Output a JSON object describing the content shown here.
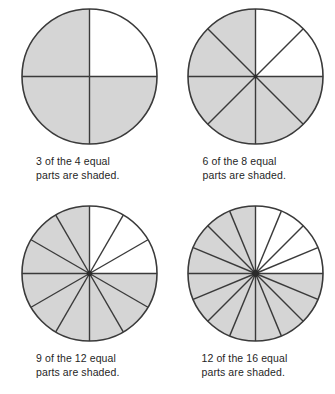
{
  "page": {
    "background_color": "#ffffff"
  },
  "style": {
    "shaded_fill": "#d5d5d5",
    "unshaded_fill": "#ffffff",
    "stroke_color": "#3a3a3a",
    "text_color": "#1f1f1f"
  },
  "figures": [
    {
      "id": "circle-4-parts",
      "total_parts": 4,
      "shaded_parts": 3,
      "unshaded_parts": 1,
      "sector_angle_degrees": 90,
      "unshaded_region": "top-right quadrant",
      "caption": "3 of the 4 equal\nparts are shaded.",
      "caption_line_1": "3 of the 4 equal",
      "caption_line_2": "parts are shaded.",
      "fraction_numerator": 3,
      "fraction_denominator": 4
    },
    {
      "id": "circle-8-parts",
      "total_parts": 8,
      "shaded_parts": 6,
      "unshaded_parts": 2,
      "sector_angle_degrees": 45,
      "unshaded_region": "top-right quadrant",
      "caption": "6 of the 8 equal\nparts are shaded.",
      "caption_line_1": "6 of the 8 equal",
      "caption_line_2": "parts are shaded.",
      "fraction_numerator": 6,
      "fraction_denominator": 8
    },
    {
      "id": "circle-12-parts",
      "total_parts": 12,
      "shaded_parts": 9,
      "unshaded_parts": 3,
      "sector_angle_degrees": 30,
      "unshaded_region": "top-right quadrant",
      "caption": "9 of the 12 equal\nparts are shaded.",
      "caption_line_1": "9 of the 12 equal",
      "caption_line_2": "parts are shaded.",
      "fraction_numerator": 9,
      "fraction_denominator": 12
    },
    {
      "id": "circle-16-parts",
      "total_parts": 16,
      "shaded_parts": 12,
      "unshaded_parts": 4,
      "sector_angle_degrees": 22.5,
      "unshaded_region": "top-right quadrant",
      "caption": "12 of the 16 equal\nparts are shaded.",
      "caption_line_1": "12 of the 16 equal",
      "caption_line_2": "parts are shaded.",
      "fraction_numerator": 12,
      "fraction_denominator": 16
    }
  ]
}
